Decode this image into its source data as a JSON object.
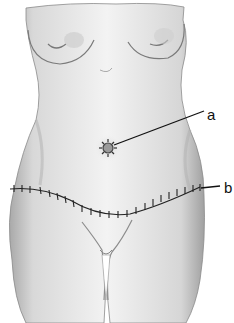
{
  "figure": {
    "labels": [
      {
        "id": "a",
        "text": "a",
        "points_to": "umbilicus (sutured)"
      },
      {
        "id": "b",
        "text": "b",
        "points_to": "lower abdominal suture line"
      }
    ],
    "colors": {
      "ink": "#111111",
      "skin_light": "#f2f2f2",
      "skin_shade": "#bdbdbd",
      "background": "#ffffff"
    }
  }
}
